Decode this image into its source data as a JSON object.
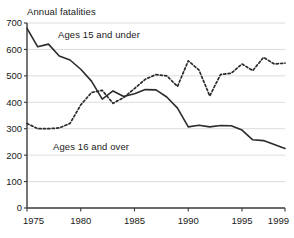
{
  "chart_data": {
    "type": "line",
    "title": "Annual fatalities",
    "xlabel": "",
    "ylabel": "Annual fatalities",
    "xlim": [
      1975,
      1999
    ],
    "ylim": [
      0,
      700
    ],
    "ytick_step": 100,
    "yticks": [
      0,
      100,
      200,
      300,
      400,
      500,
      600,
      700
    ],
    "xticks": [
      1975,
      1980,
      1985,
      1990,
      1995,
      1999
    ],
    "grid": "horizontal",
    "legend": "inline-annotation",
    "x": [
      1975,
      1976,
      1977,
      1978,
      1979,
      1980,
      1981,
      1982,
      1983,
      1984,
      1985,
      1986,
      1987,
      1988,
      1989,
      1990,
      1991,
      1992,
      1993,
      1994,
      1995,
      1996,
      1997,
      1998,
      1999
    ],
    "series": [
      {
        "name": "Ages 15 and under",
        "style": "solid",
        "color": "#2b2b2b",
        "values": [
          680,
          610,
          620,
          575,
          560,
          525,
          480,
          412,
          443,
          422,
          432,
          448,
          447,
          420,
          378,
          307,
          313,
          307,
          312,
          311,
          295,
          258,
          255,
          240,
          225
        ]
      },
      {
        "name": "Ages 16 and over",
        "style": "dotted",
        "color": "#2b2b2b",
        "values": [
          320,
          300,
          300,
          303,
          320,
          390,
          437,
          445,
          396,
          418,
          452,
          487,
          505,
          500,
          460,
          557,
          522,
          424,
          505,
          510,
          545,
          520,
          570,
          545,
          548
        ]
      }
    ]
  },
  "axis_title": "Annual fatalities",
  "labels": {
    "under": "Ages 15 and under",
    "over": "Ages 16 and over"
  },
  "colors": {
    "line": "#2b2b2b",
    "grid": "#d8d8d8",
    "axis": "#3a3a3a",
    "text": "#1a1a1a"
  }
}
